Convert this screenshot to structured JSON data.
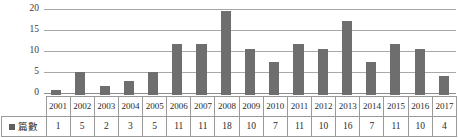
{
  "chart_data": {
    "type": "bar",
    "title": "",
    "subtitle": "",
    "xlabel": "",
    "ylabel": "",
    "categories": [
      "2001",
      "2002",
      "2003",
      "2004",
      "2005",
      "2006",
      "2007",
      "2008",
      "2009",
      "2010",
      "2011",
      "2012",
      "2013",
      "2014",
      "2015",
      "2016",
      "2017"
    ],
    "values": [
      1,
      5,
      2,
      3,
      5,
      11,
      11,
      18,
      10,
      7,
      11,
      10,
      16,
      7,
      11,
      10,
      4
    ],
    "series": [
      {
        "name": "篇數",
        "values": [
          1,
          5,
          2,
          3,
          5,
          11,
          11,
          18,
          10,
          7,
          11,
          10,
          16,
          7,
          11,
          10,
          4
        ]
      }
    ],
    "ylim": [
      0,
      20
    ],
    "yticks": [
      "0",
      "5",
      "10",
      "15",
      "20"
    ],
    "ytick_values": [
      0,
      5,
      10,
      15,
      20
    ],
    "grid": true,
    "legend_position": "table-left",
    "colors": {
      "bar": "#6e6e6e",
      "gridline": "#a8a8a8",
      "table_border": "#9a9a9a",
      "text": "#2a2a2a"
    }
  },
  "legend": {
    "marker": "square-marker",
    "label": "篇數"
  },
  "table": {
    "row_label": "篇數",
    "headers": [
      "2001",
      "2002",
      "2003",
      "2004",
      "2005",
      "2006",
      "2007",
      "2008",
      "2009",
      "2010",
      "2011",
      "2012",
      "2013",
      "2014",
      "2015",
      "2016",
      "2017"
    ],
    "values": [
      "1",
      "5",
      "2",
      "3",
      "5",
      "11",
      "11",
      "18",
      "10",
      "7",
      "11",
      "10",
      "16",
      "7",
      "11",
      "10",
      "4"
    ]
  }
}
